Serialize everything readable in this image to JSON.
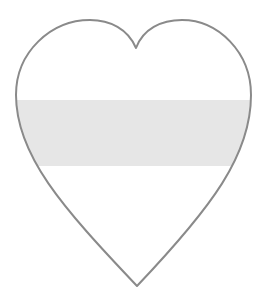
{
  "page": {
    "background_color": "#ffffff"
  },
  "figure": {
    "name": "heart-with-shaded-band",
    "description_label": "",
    "outline_color": "#8a8a8a",
    "outline_width": "2",
    "band": {
      "fill_color": "#e6e6e6",
      "top": "100",
      "height": "66",
      "left": "0",
      "width": "265"
    }
  }
}
